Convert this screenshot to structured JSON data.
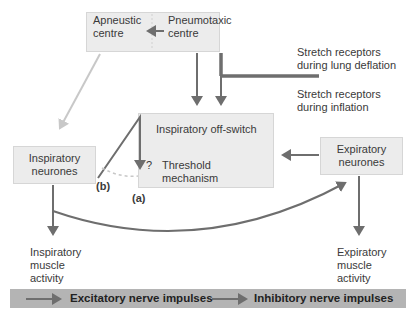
{
  "diagram": {
    "nodes": {
      "apneustic": {
        "line1": "Apneustic",
        "line2": "centre"
      },
      "pneumotaxic": {
        "line1": "Pneumotaxic",
        "line2": "centre"
      },
      "stretch_deflation": {
        "line1": "Stretch receptors",
        "line2": "during lung deflation"
      },
      "stretch_inflation": {
        "line1": "Stretch receptors",
        "line2": "during inflation"
      },
      "off_switch": {
        "title": "Inspiratory off-switch",
        "question": "?",
        "line1": "Threshold",
        "line2": "mechanism"
      },
      "inspiratory_neurones": {
        "line1": "Inspiratory",
        "line2": "neurones"
      },
      "expiratory_neurones": {
        "line1": "Expiratory",
        "line2": "neurones"
      },
      "inspiratory_activity": {
        "line1": "Inspiratory",
        "line2": "muscle",
        "line3": "activity"
      },
      "expiratory_activity": {
        "line1": "Expiratory",
        "line2": "muscle",
        "line3": "activity"
      }
    },
    "labels": {
      "a": "(a)",
      "b": "(b)"
    },
    "legend": {
      "excitatory": "Excitatory nerve impulses",
      "inhibitory": "Inhibitory nerve impulses"
    },
    "colors": {
      "excitatory": "#6e6e6e",
      "inhibitory": "#6e6e6e",
      "light_arrow": "#c8c8c8",
      "box": "#ececec",
      "legend_bg": "#b4b4b4"
    }
  }
}
